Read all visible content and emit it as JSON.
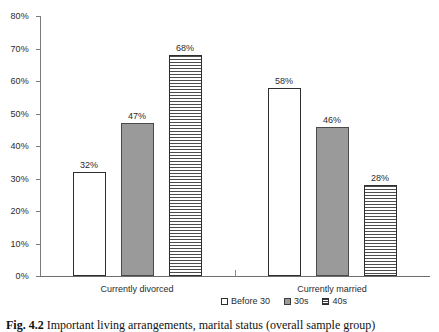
{
  "chart_data": {
    "type": "bar",
    "title": "",
    "subtitle": "",
    "xlabel": "",
    "ylabel": "",
    "categories": [
      "Currently divorced",
      "Currently married"
    ],
    "series": [
      {
        "name": "Before 30",
        "values": [
          32,
          58
        ],
        "labels": [
          "32%",
          "58%"
        ],
        "fill": "white-outline"
      },
      {
        "name": "30s",
        "values": [
          47,
          46
        ],
        "labels": [
          "47%",
          "46%"
        ],
        "fill": "solid-gray"
      },
      {
        "name": "40s",
        "values": [
          68,
          28
        ],
        "labels": [
          "68%",
          "28%"
        ],
        "fill": "horizontal-stripes"
      }
    ],
    "ylim": [
      0,
      80
    ],
    "ytick_step": 10,
    "ytick_labels": [
      "0%",
      "10%",
      "20%",
      "30%",
      "40%",
      "50%",
      "60%",
      "70%",
      "80%"
    ],
    "ytick_values": [
      0,
      10,
      20,
      30,
      40,
      50,
      60,
      70,
      80
    ],
    "grid": false,
    "legend_position": "bottom",
    "value_labels": true,
    "colors": {
      "before_30": "#ffffff",
      "thirties": "#9a9a9a",
      "forties_stripe": "#4d4d4d",
      "outline": "#2e2e2e",
      "axis": "#7a7a7a",
      "text": "#2b2b2b"
    }
  },
  "axis": {
    "y_labels": [
      "80%",
      "70%",
      "60%",
      "50%",
      "40%",
      "30%",
      "20%",
      "10%",
      "0%"
    ]
  },
  "categories": [
    {
      "label": "Currently divorced"
    },
    {
      "label": "Currently married"
    }
  ],
  "bars": [
    {
      "group": 0,
      "series": 0,
      "label": "32%"
    },
    {
      "group": 0,
      "series": 1,
      "label": "47%"
    },
    {
      "group": 0,
      "series": 2,
      "label": "68%"
    },
    {
      "group": 1,
      "series": 0,
      "label": "58%"
    },
    {
      "group": 1,
      "series": 1,
      "label": "46%"
    },
    {
      "group": 1,
      "series": 2,
      "label": "28%"
    }
  ],
  "legend": {
    "items": [
      {
        "label": "Before 30",
        "marker": "empty-square-marker"
      },
      {
        "label": "30s",
        "marker": "filled-square-marker"
      },
      {
        "label": "40s",
        "marker": "striped-square-marker"
      }
    ]
  },
  "caption": {
    "number": "Fig. 4.2",
    "text": "Important living arrangements, marital status (overall sample group)"
  }
}
